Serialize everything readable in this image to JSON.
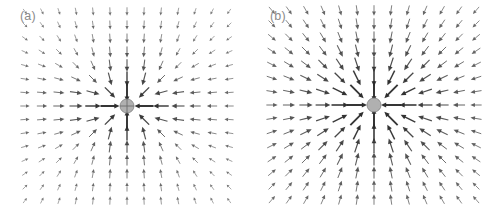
{
  "figure": {
    "background_color": "#ffffff",
    "arrow_color": "#2b2b2b",
    "marker_color": "#b0b0b0",
    "marker_edge_color": "#808080",
    "label_color": "#8a8a8a",
    "width": 500,
    "height": 218
  },
  "panels": [
    {
      "id": "panel-a",
      "label": "(a)",
      "field_type": "anisotropic-dipole-quiver",
      "center": {
        "x": 127,
        "y": 106
      },
      "marker": {
        "shape": "circle-with-crosshair",
        "radius": 7,
        "color": "#b0b0b0"
      },
      "grid": {
        "cols": 13,
        "rows": 15,
        "x_spacing": 17,
        "y_spacing": 13.5
      },
      "extent": {
        "x_min": 22,
        "x_max": 236,
        "y_min": 12,
        "y_max": 206
      },
      "description": "Quiver field converging toward a central point; long horizontal arrows along the mid row, near-vertical arrows above and below the center, magnitude decays with radius."
    },
    {
      "id": "panel-b",
      "label": "(b)",
      "field_type": "isotropic-radial-quiver",
      "center": {
        "x": 124,
        "y": 105
      },
      "marker": {
        "shape": "circle",
        "radius": 7,
        "color": "#b0b0b0"
      },
      "grid": {
        "cols": 13,
        "rows": 15,
        "x_spacing": 17,
        "y_spacing": 13.5
      },
      "extent": {
        "x_min": 18,
        "x_max": 240,
        "y_min": 10,
        "y_max": 208
      },
      "description": "Radially symmetric quiver field pointing inward toward the central disc from all directions, magnitude decays with radius."
    }
  ],
  "chart_data": {
    "type": "quiver",
    "title": "",
    "xlabel": "",
    "ylabel": "",
    "grid": false,
    "legend": null,
    "annotations": [
      "(a)",
      "(b)"
    ],
    "panels": [
      {
        "name": "(a)",
        "model": "dipole",
        "center": [
          0,
          0
        ],
        "grid_nx": 13,
        "grid_ny": 15,
        "x_range": [
          -6,
          6
        ],
        "y_range": [
          -7,
          7
        ],
        "u_formula": "-x/(r^2+e)^1.1 * (1 + 0.55*(1 - 2*y^2/(r^2+e)))",
        "v_formula": "-y/(r^2+e)^1.1 * (1 - 0.45*(1 - 2*y^2/(r^2+e)))",
        "scale": 42,
        "max_arrow_px": 19,
        "softening": 0.55,
        "note": "Anisotropic inward field: strongest along the horizontal mid-row and the vertical center column."
      },
      {
        "name": "(b)",
        "model": "radial",
        "center": [
          0,
          0
        ],
        "grid_nx": 13,
        "grid_ny": 15,
        "x_range": [
          -6,
          6
        ],
        "y_range": [
          -7,
          7
        ],
        "u_formula": "-x/(r^2+e)^1.0",
        "v_formula": "-y/(r^2+e)^1.0",
        "scale": 40,
        "max_arrow_px": 20,
        "softening": 0.55,
        "note": "Isotropic inward radial field, uniform angular distribution."
      }
    ]
  }
}
